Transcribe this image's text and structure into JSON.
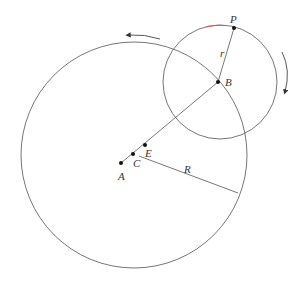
{
  "diagram": {
    "labels": {
      "P": "P",
      "r": "r",
      "B": "B",
      "E": "E",
      "C": "C",
      "A": "A",
      "R": "R"
    },
    "colors": {
      "line": "#555555",
      "point": "#111111",
      "text": "#333333",
      "highlight": "#d9534f"
    },
    "big_circle": {
      "cx": 134,
      "cy": 155,
      "r": 113
    },
    "small_circle": {
      "cx": 220,
      "cy": 82,
      "r": 57
    },
    "points": {
      "P": [
        234,
        28
      ],
      "B": [
        218,
        82
      ],
      "E": [
        145,
        145
      ],
      "C": [
        133,
        154
      ],
      "A": [
        121,
        163
      ]
    },
    "arrows": [
      "counterclockwise-top",
      "clockwise-right"
    ]
  }
}
